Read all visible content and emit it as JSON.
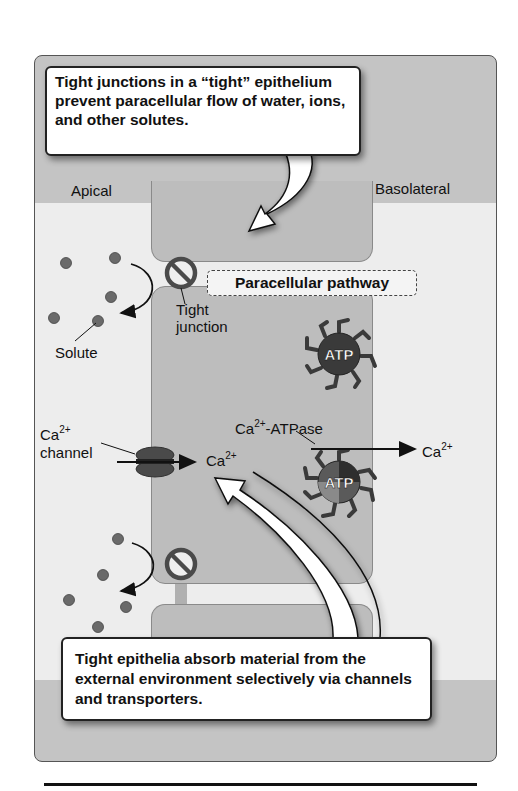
{
  "figure": {
    "callouts": {
      "top": "Tight junctions in a “tight” epithelium prevent paracellular flow of water, ions, and other solutes.",
      "bottom": "Tight epithelia absorb material from the external environment selectively via channels and transporters."
    },
    "sides": {
      "apical": "Apical",
      "basolateral": "Basolateral"
    },
    "labels": {
      "paracellular_pathway": "Paracellular pathway",
      "solute": "Solute",
      "tight_junction_line1": "Tight",
      "tight_junction_line2": "junction",
      "ca_channel_ion": "Ca",
      "ca_channel_charge": "2+",
      "channel_word": "channel",
      "ca_inside_ion": "Ca",
      "ca_inside_charge": "2+",
      "atpase_ion": "Ca",
      "atpase_charge": "2+",
      "atpase_suffix": "-ATPase",
      "ca_out_ion": "Ca",
      "ca_out_charge": "2+",
      "atp_upper": "ATP",
      "atp_lower": "ATP"
    },
    "colors": {
      "panel_bg": "#c4c4c4",
      "lumen_bg": "#ededed",
      "cell_fill": "#bdbdbd",
      "solute": "#6a6a6a",
      "blocked_symbol": "#4a4a4a",
      "atp_body": "#3a3a3a"
    }
  }
}
